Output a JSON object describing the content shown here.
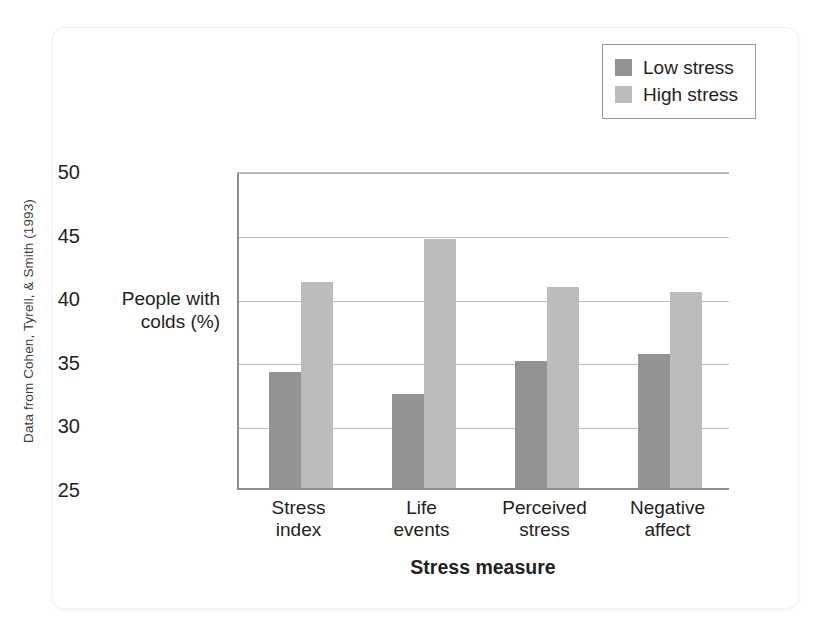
{
  "source_credit": "Data from Cohen, Tyrell, & Smith (1993)",
  "legend": {
    "entries": [
      {
        "label": "Low stress",
        "color": "#939393",
        "swatch_name": "low-stress-swatch"
      },
      {
        "label": "High stress",
        "color": "#bcbcbc",
        "swatch_name": "high-stress-swatch"
      }
    ]
  },
  "chart_data": {
    "type": "bar",
    "title": "",
    "xlabel": "Stress measure",
    "ylabel": "People with\ncolds (%)",
    "categories": [
      "Stress\nindex",
      "Life\nevents",
      "Perceived\nstress",
      "Negative\naffect"
    ],
    "series": [
      {
        "name": "Low stress",
        "color": "#939393",
        "values": [
          34.1,
          32.4,
          35.0,
          35.5
        ]
      },
      {
        "name": "High stress",
        "color": "#bcbcbc",
        "values": [
          41.2,
          44.6,
          40.8,
          40.4
        ]
      }
    ],
    "ylim": [
      25,
      50
    ],
    "yticks": [
      25,
      30,
      35,
      40,
      45,
      50
    ],
    "grid": true,
    "legend_position": "top-right"
  }
}
